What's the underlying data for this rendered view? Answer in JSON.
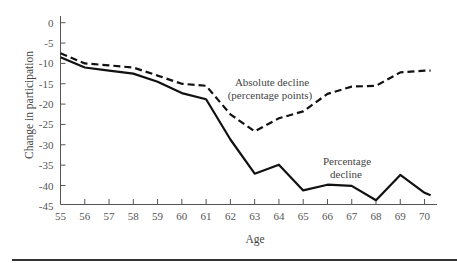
{
  "chart_data": {
    "type": "line",
    "title": "",
    "xlabel": "Age",
    "ylabel": "Change in participation",
    "xlim": [
      55,
      70.25
    ],
    "ylim": [
      -45,
      0
    ],
    "grid": false,
    "legend": "inline annotations",
    "x_ticks": [
      55,
      56,
      57,
      58,
      59,
      60,
      61,
      62,
      63,
      64,
      65,
      66,
      67,
      68,
      69,
      70
    ],
    "y_ticks": [
      0,
      -5,
      -10,
      -15,
      -20,
      -25,
      -30,
      -35,
      -40,
      -45
    ],
    "x": [
      55,
      56,
      57,
      58,
      59,
      60,
      61,
      62,
      63,
      64,
      65,
      66,
      67,
      68,
      69,
      70,
      70.25
    ],
    "series": [
      {
        "name": "Absolute decline (percentage points)",
        "style": "dashed",
        "values": [
          -7.5,
          -10,
          -10.5,
          -11,
          -13,
          -15,
          -15.5,
          -22.5,
          -26.7,
          -23.5,
          -21.8,
          -17.5,
          -15.7,
          -15.5,
          -12.2,
          -11.8,
          -11.8
        ]
      },
      {
        "name": "Percentage decline",
        "style": "solid",
        "values": [
          -8.5,
          -11,
          -11.8,
          -12.5,
          -14.5,
          -17.3,
          -18.8,
          -28.7,
          -37.1,
          -34.9,
          -41.2,
          -39.8,
          -40.1,
          -43.6,
          -37.4,
          -41.8,
          -42.4
        ]
      }
    ],
    "annotations": [
      {
        "text_lines": [
          "Absolute decline",
          "(percentage points)"
        ],
        "series": "Absolute decline (percentage points)"
      },
      {
        "text_lines": [
          "Percentage",
          "decline"
        ],
        "series": "Percentage decline"
      }
    ]
  },
  "labels": {
    "x_axis": "Age",
    "y_axis": "Change in participation",
    "annot_abs_1": "Absolute decline",
    "annot_abs_2": "(percentage points)",
    "annot_pct_1": "Percentage",
    "annot_pct_2": "decline"
  }
}
